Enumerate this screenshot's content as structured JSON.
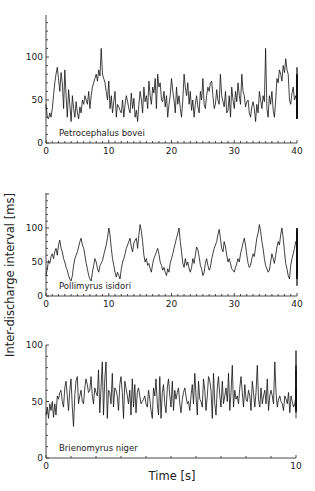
{
  "ylabel": "Inter-discharge interval [ms]",
  "xlabel": "Time [s]",
  "colors": {
    "trace": "#111111",
    "axis": "#333333",
    "background": "#ffffff"
  },
  "chart_data": [
    {
      "type": "line",
      "title": "Petrocephalus bovei",
      "xlabel": "",
      "ylabel": "Inter-discharge interval [ms]",
      "xlim": [
        0,
        40
      ],
      "ylim": [
        0,
        150
      ],
      "xticks": [
        0,
        10,
        20,
        30,
        40
      ],
      "yticks": [
        0,
        50,
        100
      ],
      "grid": false,
      "layout": {
        "x0": 46,
        "x1": 297,
        "y0": 143,
        "y100": 57,
        "ytop": 15
      },
      "x_step": 0.2,
      "values": [
        45,
        30,
        28,
        35,
        30,
        40,
        55,
        70,
        80,
        88,
        75,
        60,
        82,
        70,
        40,
        85,
        55,
        30,
        62,
        45,
        25,
        55,
        40,
        30,
        48,
        35,
        28,
        42,
        35,
        50,
        45,
        55,
        50,
        45,
        60,
        40,
        55,
        65,
        70,
        75,
        80,
        72,
        85,
        78,
        110,
        80,
        75,
        70,
        60,
        50,
        72,
        40,
        55,
        35,
        48,
        60,
        30,
        45,
        42,
        38,
        35,
        50,
        30,
        45,
        55,
        48,
        40,
        35,
        58,
        40,
        52,
        30,
        38,
        25,
        45,
        60,
        50,
        35,
        65,
        48,
        55,
        40,
        72,
        55,
        45,
        65,
        58,
        75,
        40,
        80,
        65,
        70,
        50,
        48,
        60,
        42,
        55,
        30,
        45,
        55,
        75,
        60,
        50,
        35,
        65,
        45,
        55,
        40,
        30,
        50,
        80,
        65,
        55,
        70,
        45,
        60,
        38,
        50,
        30,
        45,
        55,
        42,
        35,
        60,
        50,
        75,
        45,
        40,
        55,
        65,
        60,
        70,
        72,
        55,
        40,
        45,
        62,
        50,
        45,
        80,
        55,
        48,
        42,
        60,
        35,
        38,
        55,
        30,
        65,
        50,
        40,
        60,
        48,
        70,
        55,
        45,
        80,
        60,
        55,
        42,
        48,
        50,
        35,
        30,
        42,
        48,
        40,
        25,
        45,
        35,
        60,
        50,
        40,
        55,
        48,
        110,
        40,
        30,
        55,
        45,
        60,
        38,
        30,
        50,
        75,
        70,
        85,
        80,
        72,
        90,
        82,
        98,
        85,
        80,
        50,
        45,
        58,
        65,
        50,
        55,
        48,
        52,
        45,
        50,
        48,
        58,
        70,
        80,
        55,
        45,
        40,
        70,
        60,
        50,
        45,
        38,
        35,
        30,
        40,
        28,
        45,
        38,
        52,
        48,
        62,
        55,
        70,
        58,
        65,
        50,
        60,
        55,
        45,
        50,
        42,
        48,
        55,
        62,
        78,
        65,
        70,
        60,
        72,
        55,
        48,
        58,
        52,
        45,
        30,
        40,
        50,
        55,
        70,
        45,
        62,
        55,
        58,
        48,
        65,
        42,
        30,
        38,
        55,
        60,
        48,
        75,
        65,
        50,
        40,
        28,
        55,
        60,
        45,
        38,
        62,
        55,
        48,
        70,
        40,
        45,
        60,
        58,
        65,
        50,
        55,
        72,
        88,
        60,
        45,
        50,
        40,
        52,
        58,
        65,
        55,
        48,
        70,
        80,
        58,
        45,
        30,
        60,
        65,
        55,
        48,
        70,
        45,
        52,
        38,
        30,
        42,
        28,
        45,
        60,
        55,
        40,
        35,
        50,
        45,
        30,
        48,
        35,
        55,
        40,
        38,
        50,
        60,
        72,
        55,
        48,
        42,
        40,
        55,
        62,
        70,
        58,
        45,
        52,
        78,
        70,
        65,
        45,
        50,
        40,
        30,
        55,
        68,
        60,
        52,
        48,
        62,
        70,
        55,
        45,
        40,
        30,
        28
      ],
      "label_pos": {
        "x": 59,
        "y": 136
      }
    },
    {
      "type": "line",
      "title": "Pollimyrus isidori",
      "xlabel": "",
      "ylabel": "Inter-discharge interval [ms]",
      "xlim": [
        0,
        40
      ],
      "ylim": [
        0,
        150
      ],
      "xticks": [
        0,
        10,
        20,
        30,
        40
      ],
      "yticks": [
        0,
        50,
        100
      ],
      "grid": false,
      "layout": {
        "x0": 46,
        "x1": 297,
        "y0": 296,
        "y100": 228,
        "ytop": 193
      },
      "x_step": 0.2,
      "values": [
        30,
        40,
        52,
        48,
        58,
        62,
        55,
        65,
        70,
        60,
        75,
        82,
        70,
        65,
        55,
        50,
        42,
        38,
        30,
        25,
        22,
        30,
        45,
        55,
        60,
        65,
        72,
        80,
        85,
        75,
        70,
        60,
        48,
        40,
        30,
        25,
        22,
        35,
        45,
        55,
        50,
        40,
        35,
        45,
        48,
        52,
        60,
        68,
        75,
        85,
        100,
        90,
        70,
        55,
        45,
        35,
        28,
        35,
        30,
        25,
        40,
        50,
        55,
        62,
        70,
        75,
        80,
        85,
        72,
        65,
        78,
        82,
        85,
        70,
        90,
        105,
        95,
        80,
        60,
        50,
        55,
        45,
        48,
        40,
        35,
        48,
        55,
        60,
        65,
        70,
        62,
        50,
        45,
        38,
        42,
        35,
        30,
        40,
        35,
        48,
        55,
        62,
        70,
        78,
        85,
        92,
        100,
        80,
        65,
        48,
        42,
        55,
        45,
        50,
        40,
        35,
        42,
        55,
        48,
        60,
        72,
        68,
        58,
        45,
        40,
        30,
        35,
        48,
        55,
        45,
        38,
        42,
        55,
        62,
        70,
        75,
        80,
        90,
        98,
        85,
        70,
        65,
        80,
        72,
        60,
        50,
        55,
        48,
        40,
        38,
        35,
        42,
        48,
        55,
        50,
        62,
        70,
        78,
        85,
        75,
        60,
        48,
        42,
        45,
        55,
        62,
        58,
        72,
        85,
        92,
        105,
        95,
        80,
        70,
        55,
        45,
        40,
        35,
        38,
        50,
        62,
        55,
        48,
        60,
        72,
        80,
        75,
        90,
        100,
        85,
        65,
        48,
        40,
        30,
        25,
        45,
        55,
        62,
        70,
        80,
        75,
        90,
        85,
        70,
        55,
        48,
        38,
        30,
        45,
        55,
        62,
        48,
        35,
        30,
        25,
        40,
        50,
        55,
        45,
        48,
        55,
        62,
        50,
        42,
        38,
        45,
        50,
        55,
        48,
        42,
        50,
        58,
        62,
        55,
        70,
        72,
        65,
        80,
        75,
        70,
        58,
        45,
        38,
        40,
        45,
        48,
        52,
        42,
        35,
        30,
        38,
        45,
        55,
        48,
        42,
        50,
        62,
        70,
        55,
        48,
        42,
        50,
        45,
        38,
        40,
        35,
        42,
        48,
        55,
        50,
        45,
        52,
        48,
        38,
        30,
        45,
        50,
        45,
        55,
        48,
        40,
        35,
        28,
        45,
        50,
        55,
        48,
        42,
        35,
        40,
        48,
        55,
        45,
        38,
        35,
        42,
        55,
        60,
        50,
        45,
        38,
        52,
        48,
        55,
        62,
        58,
        50,
        45,
        52,
        55,
        48,
        62,
        70,
        55,
        45,
        40,
        48,
        52,
        58,
        62,
        55,
        48,
        40,
        35,
        30,
        38,
        42,
        35,
        40,
        38,
        32,
        45,
        35,
        40,
        38,
        30,
        48,
        42,
        45,
        38,
        35,
        55,
        62,
        70,
        75,
        80,
        95,
        100,
        80,
        65,
        50,
        45,
        60,
        70,
        80,
        95,
        90,
        70,
        55,
        50,
        80,
        100,
        95,
        70,
        60,
        50,
        75,
        92,
        98,
        80,
        65,
        55,
        42,
        35,
        30,
        25,
        38,
        45,
        35,
        30,
        40,
        38,
        32,
        15,
        40,
        45,
        48,
        55,
        62,
        58,
        65,
        70,
        60,
        72,
        78,
        85,
        90,
        95
      ]
    },
    {
      "type": "line",
      "title": "Brienomyrus niger",
      "xlabel": "Time [s]",
      "ylabel": "Inter-discharge interval [ms]",
      "xlim": [
        0,
        10
      ],
      "ylim": [
        0,
        100
      ],
      "xticks": [
        0,
        10
      ],
      "yticks": [
        0,
        50,
        100
      ],
      "grid": false,
      "layout": {
        "x0": 46,
        "x1": 296,
        "y0": 458,
        "y100": 345,
        "ytop": 345
      },
      "x_step": 0.05,
      "values": [
        38,
        45,
        35,
        48,
        42,
        50,
        36,
        48,
        38,
        55,
        52,
        58,
        60,
        50,
        45,
        62,
        68,
        55,
        42,
        60,
        70,
        45,
        28,
        55,
        68,
        72,
        48,
        55,
        60,
        50,
        48,
        62,
        70,
        65,
        58,
        60,
        72,
        55,
        48,
        62,
        58,
        55,
        78,
        40,
        62,
        85,
        38,
        70,
        85,
        35,
        60,
        58,
        48,
        75,
        45,
        62,
        60,
        55,
        42,
        65,
        72,
        58,
        35,
        68,
        62,
        55,
        48,
        60,
        38,
        70,
        45,
        65,
        40,
        58,
        62,
        55,
        48,
        50,
        52,
        55,
        48,
        45,
        60,
        52,
        42,
        35,
        62,
        55,
        70,
        48,
        38,
        72,
        35,
        58,
        65,
        48,
        40,
        62,
        70,
        55,
        45,
        68,
        42,
        60,
        52,
        58,
        62,
        48,
        40,
        52,
        58,
        62,
        55,
        48,
        50,
        42,
        55,
        65,
        48,
        75,
        55,
        38,
        68,
        52,
        50,
        45,
        70,
        60,
        42,
        55,
        72,
        68,
        60,
        35,
        75,
        48,
        38,
        62,
        72,
        55,
        45,
        68,
        48,
        55,
        62,
        50,
        75,
        42,
        58,
        82,
        45,
        60,
        52,
        55,
        48,
        62,
        72,
        58,
        45,
        65,
        52,
        50,
        60,
        55,
        42,
        68,
        58,
        45,
        58,
        82,
        52,
        45,
        62,
        48,
        55,
        60,
        48,
        70,
        42,
        55,
        60,
        55,
        48,
        85,
        58,
        45,
        52,
        55,
        50,
        48,
        42,
        55,
        52,
        48,
        58,
        40,
        55,
        50,
        45,
        48,
        55,
        42,
        50,
        58,
        48,
        42,
        52,
        48,
        55,
        60,
        45,
        50,
        62,
        55,
        52,
        55,
        58,
        60,
        70,
        80,
        88,
        92,
        95,
        95,
        95,
        95,
        88,
        80,
        65,
        55,
        78,
        72,
        68,
        82,
        62,
        58,
        48,
        55,
        68,
        60,
        55,
        42,
        50,
        62,
        55,
        45,
        40,
        55,
        58,
        48,
        42,
        55,
        35
      ],
      "label_pos": {
        "x": 59,
        "y": 451
      }
    }
  ],
  "panels": [
    {
      "name": "Petrocephalus bovei",
      "x_ticks": [
        "0",
        "10",
        "20",
        "30",
        "40"
      ],
      "y_ticks": [
        "0",
        "50",
        "100"
      ]
    },
    {
      "name": "Pollimyrus isidori",
      "x_ticks": [
        "0",
        "10",
        "20",
        "30",
        "40"
      ],
      "y_ticks": [
        "0",
        "50",
        "100"
      ]
    },
    {
      "name": "Brienomyrus niger",
      "x_ticks": [
        "0",
        "10"
      ],
      "y_ticks": [
        "0",
        "50",
        "100"
      ]
    }
  ]
}
